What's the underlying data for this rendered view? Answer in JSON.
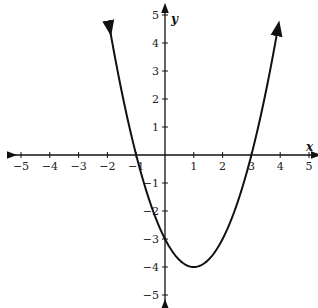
{
  "chart_data": {
    "type": "line",
    "title": "",
    "xlabel": "x",
    "ylabel": "y",
    "xlim": [
      -5,
      5
    ],
    "ylim": [
      -5,
      5
    ],
    "grid": false,
    "x_ticks": [
      -5,
      -4,
      -3,
      -2,
      -1,
      1,
      2,
      3,
      4,
      5
    ],
    "y_ticks": [
      5,
      4,
      3,
      2,
      1,
      -1,
      -2,
      -3,
      -4,
      -5
    ],
    "x_tick_labels": [
      "-5",
      "-4",
      "-3",
      "-2",
      "-1",
      "1",
      "2",
      "3",
      "4",
      "5"
    ],
    "y_tick_labels": [
      "5",
      "4",
      "3",
      "2",
      "1",
      "-1",
      "-2",
      "-3",
      "-4",
      "-5"
    ],
    "series": [
      {
        "name": "parabola",
        "equation": "y = x^2 - 2x - 3",
        "x": [
          -1.9,
          -1.5,
          -1,
          -0.5,
          0,
          0.5,
          1,
          1.5,
          2,
          2.5,
          3,
          3.5,
          3.9
        ],
        "y": [
          4.41,
          2.25,
          0,
          -1.75,
          -3,
          -3.75,
          -4,
          -3.75,
          -3,
          -1.75,
          0,
          2.25,
          4.41
        ]
      }
    ],
    "annotations": {
      "vertex": [
        1,
        -4
      ],
      "x_intercepts": [
        -1,
        3
      ],
      "y_intercept": -3
    }
  }
}
